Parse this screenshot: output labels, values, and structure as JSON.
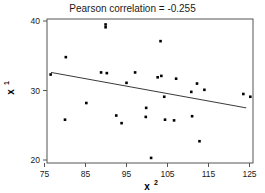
{
  "chart_data": {
    "type": "scatter",
    "title": "Pearson correlation = -0.255",
    "xlabel": "x2",
    "xlabel_base": "x",
    "xlabel_sup": "2",
    "ylabel": "x1",
    "ylabel_base": "x",
    "ylabel_sup": "1",
    "xlim": [
      75,
      126.5
    ],
    "ylim": [
      19.2,
      40.3
    ],
    "xticks": [
      75,
      85,
      95,
      105,
      115,
      125
    ],
    "xtick_labels": [
      "75",
      "85",
      "95",
      "105",
      "115",
      "125"
    ],
    "yticks": [
      20,
      30,
      40
    ],
    "ytick_labels": [
      "20",
      "30",
      "40"
    ],
    "grid": false,
    "legend": null,
    "pearson_r": -0.255,
    "marker_color": "#000000",
    "line_color": "#3a3a3a",
    "frame_color": "#555555",
    "points": [
      {
        "x": 76.5,
        "y": 32.3
      },
      {
        "x": 80.2,
        "y": 34.8
      },
      {
        "x": 80.0,
        "y": 25.8
      },
      {
        "x": 85.2,
        "y": 28.2
      },
      {
        "x": 89.9,
        "y": 39.5
      },
      {
        "x": 89.9,
        "y": 39.1
      },
      {
        "x": 88.8,
        "y": 32.6
      },
      {
        "x": 90.2,
        "y": 32.5
      },
      {
        "x": 92.5,
        "y": 26.4
      },
      {
        "x": 93.8,
        "y": 25.3
      },
      {
        "x": 95.0,
        "y": 31.1
      },
      {
        "x": 97.1,
        "y": 32.6
      },
      {
        "x": 99.8,
        "y": 27.5
      },
      {
        "x": 99.7,
        "y": 26.2
      },
      {
        "x": 101.0,
        "y": 20.3
      },
      {
        "x": 102.6,
        "y": 31.9
      },
      {
        "x": 103.5,
        "y": 32.1
      },
      {
        "x": 103.3,
        "y": 37.1
      },
      {
        "x": 104.2,
        "y": 29.1
      },
      {
        "x": 104.4,
        "y": 25.8
      },
      {
        "x": 106.6,
        "y": 25.7
      },
      {
        "x": 107.1,
        "y": 31.7
      },
      {
        "x": 110.8,
        "y": 29.8
      },
      {
        "x": 111.0,
        "y": 26.3
      },
      {
        "x": 112.2,
        "y": 31.0
      },
      {
        "x": 112.8,
        "y": 22.7
      },
      {
        "x": 114.0,
        "y": 30.1
      },
      {
        "x": 123.5,
        "y": 29.5
      },
      {
        "x": 125.2,
        "y": 29.1
      }
    ],
    "fit_line": {
      "x1": 76.6,
      "y1": 32.6,
      "x2": 124.2,
      "y2": 27.5
    }
  }
}
